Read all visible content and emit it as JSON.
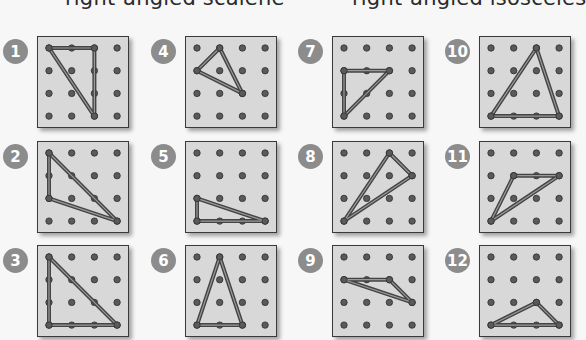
{
  "headings": [
    {
      "text": "right-angled scalene",
      "x": 65
    },
    {
      "text": "right-angled isosceles",
      "x": 352
    }
  ],
  "colors": {
    "board_bg": "#d8d8d8",
    "board_border": "#3a3a3a",
    "peg": "#5a5a5a",
    "band": "#444444",
    "badge": "#8c8c8c"
  },
  "grid": {
    "cols": 4,
    "rows": 4,
    "peg_offset": 11,
    "peg_step": 22.7
  },
  "boards": [
    {
      "number": "1",
      "x": 37,
      "y": 36,
      "triangle": [
        [
          0,
          0
        ],
        [
          2,
          0
        ],
        [
          2,
          3
        ]
      ]
    },
    {
      "number": "2",
      "x": 37,
      "y": 141,
      "triangle": [
        [
          0,
          0
        ],
        [
          0,
          2
        ],
        [
          3,
          3
        ]
      ]
    },
    {
      "number": "3",
      "x": 37,
      "y": 245,
      "triangle": [
        [
          0,
          0
        ],
        [
          0,
          3
        ],
        [
          3,
          3
        ]
      ]
    },
    {
      "number": "4",
      "x": 185,
      "y": 36,
      "triangle": [
        [
          1,
          0
        ],
        [
          0,
          1
        ],
        [
          2,
          2
        ]
      ]
    },
    {
      "number": "5",
      "x": 185,
      "y": 141,
      "triangle": [
        [
          0,
          2
        ],
        [
          0,
          3
        ],
        [
          3,
          3
        ]
      ]
    },
    {
      "number": "6",
      "x": 185,
      "y": 245,
      "triangle": [
        [
          1,
          0
        ],
        [
          0,
          3
        ],
        [
          2,
          3
        ]
      ]
    },
    {
      "number": "7",
      "x": 332,
      "y": 36,
      "triangle": [
        [
          0,
          1
        ],
        [
          2,
          1
        ],
        [
          0,
          3
        ]
      ]
    },
    {
      "number": "8",
      "x": 332,
      "y": 141,
      "triangle": [
        [
          2,
          0
        ],
        [
          3,
          1
        ],
        [
          0,
          3
        ]
      ]
    },
    {
      "number": "9",
      "x": 332,
      "y": 245,
      "triangle": [
        [
          0,
          1
        ],
        [
          2,
          1
        ],
        [
          3,
          2
        ]
      ]
    },
    {
      "number": "10",
      "x": 479,
      "y": 36,
      "triangle": [
        [
          2,
          0
        ],
        [
          0,
          3
        ],
        [
          3,
          3
        ]
      ]
    },
    {
      "number": "11",
      "x": 479,
      "y": 141,
      "triangle": [
        [
          1,
          1
        ],
        [
          3,
          1
        ],
        [
          0,
          3
        ]
      ]
    },
    {
      "number": "12",
      "x": 479,
      "y": 245,
      "triangle": [
        [
          2,
          2
        ],
        [
          0,
          3
        ],
        [
          3,
          3
        ]
      ]
    }
  ]
}
